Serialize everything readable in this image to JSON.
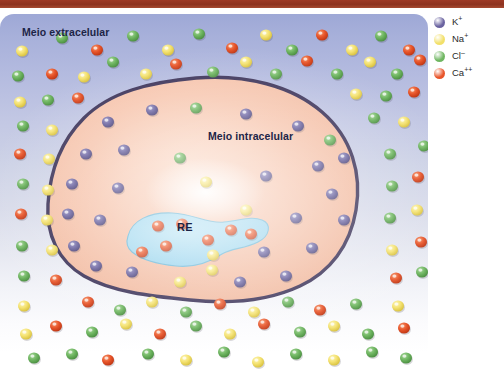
{
  "figure": {
    "title_bar_color": "#8e3320",
    "panel": {
      "extracellular_label": "Meio extracelular",
      "intracellular_label": "Meio intracelular",
      "organelle_label": "RE",
      "extracellular_bg_top": "#9ea8d6",
      "extracellular_bg_bottom": "#ffffff",
      "cytoplasm_color": "#f6c3ac",
      "membrane_color": "#3b3258",
      "organelle_color": "#9ed7ef"
    }
  },
  "legend": {
    "items": [
      {
        "label": "K",
        "charge": "+",
        "color": "#6a63a0",
        "name": "potassium"
      },
      {
        "label": "Na",
        "charge": "+",
        "color": "#f2e06a",
        "name": "sodium"
      },
      {
        "label": "Cl",
        "charge": "–",
        "color": "#6fb661",
        "name": "chloride"
      },
      {
        "label": "Ca",
        "charge": "++",
        "color": "#e8552a",
        "name": "calcium"
      }
    ]
  },
  "ions": {
    "colors": {
      "K": {
        "fill": "#6a63a0",
        "light": "#9a95c4",
        "dark": "#4a4279"
      },
      "Na": {
        "fill": "#f4e271",
        "light": "#fdf6bb",
        "dark": "#d9c23f"
      },
      "Cl": {
        "fill": "#6fb661",
        "light": "#a8d79c",
        "dark": "#4b8f41"
      },
      "Ca": {
        "fill": "#e8552a",
        "light": "#f59a6e",
        "dark": "#bf3714"
      }
    },
    "radius": 6.0,
    "extracellular": [
      {
        "t": "Na",
        "x": 22,
        "y": 37
      },
      {
        "t": "Cl",
        "x": 62,
        "y": 24
      },
      {
        "t": "Ca",
        "x": 97,
        "y": 36
      },
      {
        "t": "Cl",
        "x": 133,
        "y": 22
      },
      {
        "t": "Na",
        "x": 168,
        "y": 36
      },
      {
        "t": "Cl",
        "x": 199,
        "y": 20
      },
      {
        "t": "Ca",
        "x": 232,
        "y": 34
      },
      {
        "t": "Na",
        "x": 266,
        "y": 21
      },
      {
        "t": "Cl",
        "x": 292,
        "y": 36
      },
      {
        "t": "Ca",
        "x": 322,
        "y": 21
      },
      {
        "t": "Na",
        "x": 352,
        "y": 36
      },
      {
        "t": "Cl",
        "x": 381,
        "y": 22
      },
      {
        "t": "Ca",
        "x": 409,
        "y": 36
      },
      {
        "t": "Cl",
        "x": 18,
        "y": 62
      },
      {
        "t": "Ca",
        "x": 52,
        "y": 60
      },
      {
        "t": "Na",
        "x": 84,
        "y": 63
      },
      {
        "t": "Cl",
        "x": 113,
        "y": 48
      },
      {
        "t": "Na",
        "x": 146,
        "y": 60
      },
      {
        "t": "Ca",
        "x": 176,
        "y": 50
      },
      {
        "t": "Cl",
        "x": 213,
        "y": 58
      },
      {
        "t": "Na",
        "x": 246,
        "y": 48
      },
      {
        "t": "Cl",
        "x": 276,
        "y": 60
      },
      {
        "t": "Ca",
        "x": 307,
        "y": 47
      },
      {
        "t": "Cl",
        "x": 337,
        "y": 60
      },
      {
        "t": "Na",
        "x": 370,
        "y": 48
      },
      {
        "t": "Cl",
        "x": 397,
        "y": 60
      },
      {
        "t": "Ca",
        "x": 420,
        "y": 46
      },
      {
        "t": "Na",
        "x": 20,
        "y": 88
      },
      {
        "t": "Cl",
        "x": 48,
        "y": 86
      },
      {
        "t": "Ca",
        "x": 78,
        "y": 84
      },
      {
        "t": "Na",
        "x": 356,
        "y": 80
      },
      {
        "t": "Cl",
        "x": 386,
        "y": 82
      },
      {
        "t": "Ca",
        "x": 414,
        "y": 78
      },
      {
        "t": "Cl",
        "x": 23,
        "y": 112
      },
      {
        "t": "Na",
        "x": 52,
        "y": 116
      },
      {
        "t": "Ca",
        "x": 20,
        "y": 140
      },
      {
        "t": "Cl",
        "x": 374,
        "y": 104
      },
      {
        "t": "Na",
        "x": 404,
        "y": 108
      },
      {
        "t": "Cl",
        "x": 424,
        "y": 132
      },
      {
        "t": "Na",
        "x": 49,
        "y": 145
      },
      {
        "t": "Cl",
        "x": 23,
        "y": 170
      },
      {
        "t": "Na",
        "x": 48,
        "y": 176
      },
      {
        "t": "Cl",
        "x": 390,
        "y": 140
      },
      {
        "t": "Ca",
        "x": 418,
        "y": 163
      },
      {
        "t": "Cl",
        "x": 392,
        "y": 172
      },
      {
        "t": "Ca",
        "x": 21,
        "y": 200
      },
      {
        "t": "Na",
        "x": 47,
        "y": 206
      },
      {
        "t": "Cl",
        "x": 22,
        "y": 232
      },
      {
        "t": "Na",
        "x": 52,
        "y": 236
      },
      {
        "t": "Na",
        "x": 417,
        "y": 196
      },
      {
        "t": "Cl",
        "x": 390,
        "y": 204
      },
      {
        "t": "Ca",
        "x": 421,
        "y": 228
      },
      {
        "t": "Na",
        "x": 392,
        "y": 236
      },
      {
        "t": "Cl",
        "x": 24,
        "y": 262
      },
      {
        "t": "Ca",
        "x": 56,
        "y": 266
      },
      {
        "t": "Na",
        "x": 24,
        "y": 292
      },
      {
        "t": "Ca",
        "x": 396,
        "y": 264
      },
      {
        "t": "Cl",
        "x": 422,
        "y": 258
      },
      {
        "t": "Na",
        "x": 398,
        "y": 292
      },
      {
        "t": "Ca",
        "x": 88,
        "y": 288
      },
      {
        "t": "Cl",
        "x": 120,
        "y": 296
      },
      {
        "t": "Na",
        "x": 152,
        "y": 288
      },
      {
        "t": "Cl",
        "x": 186,
        "y": 298
      },
      {
        "t": "Ca",
        "x": 220,
        "y": 290
      },
      {
        "t": "Na",
        "x": 254,
        "y": 298
      },
      {
        "t": "Cl",
        "x": 288,
        "y": 288
      },
      {
        "t": "Ca",
        "x": 320,
        "y": 296
      },
      {
        "t": "Cl",
        "x": 356,
        "y": 290
      },
      {
        "t": "Ca",
        "x": 56,
        "y": 312
      },
      {
        "t": "Cl",
        "x": 92,
        "y": 318
      },
      {
        "t": "Na",
        "x": 126,
        "y": 310
      },
      {
        "t": "Ca",
        "x": 160,
        "y": 320
      },
      {
        "t": "Cl",
        "x": 196,
        "y": 312
      },
      {
        "t": "Na",
        "x": 230,
        "y": 320
      },
      {
        "t": "Ca",
        "x": 264,
        "y": 310
      },
      {
        "t": "Cl",
        "x": 300,
        "y": 318
      },
      {
        "t": "Na",
        "x": 334,
        "y": 312
      },
      {
        "t": "Cl",
        "x": 368,
        "y": 320
      },
      {
        "t": "Ca",
        "x": 404,
        "y": 314
      },
      {
        "t": "Na",
        "x": 26,
        "y": 320
      },
      {
        "t": "Cl",
        "x": 34,
        "y": 344
      },
      {
        "t": "Cl",
        "x": 72,
        "y": 340
      },
      {
        "t": "Ca",
        "x": 108,
        "y": 346
      },
      {
        "t": "Cl",
        "x": 148,
        "y": 340
      },
      {
        "t": "Na",
        "x": 186,
        "y": 346
      },
      {
        "t": "Cl",
        "x": 224,
        "y": 338
      },
      {
        "t": "Na",
        "x": 258,
        "y": 348
      },
      {
        "t": "Cl",
        "x": 296,
        "y": 340
      },
      {
        "t": "Na",
        "x": 334,
        "y": 346
      },
      {
        "t": "Cl",
        "x": 372,
        "y": 338
      },
      {
        "t": "Cl",
        "x": 406,
        "y": 344
      }
    ],
    "intracellular": [
      {
        "t": "K",
        "x": 108,
        "y": 108
      },
      {
        "t": "K",
        "x": 152,
        "y": 96
      },
      {
        "t": "Cl",
        "x": 196,
        "y": 94
      },
      {
        "t": "K",
        "x": 246,
        "y": 100
      },
      {
        "t": "K",
        "x": 298,
        "y": 112
      },
      {
        "t": "Cl",
        "x": 330,
        "y": 126
      },
      {
        "t": "K",
        "x": 86,
        "y": 140
      },
      {
        "t": "K",
        "x": 124,
        "y": 136
      },
      {
        "t": "Cl",
        "x": 180,
        "y": 144
      },
      {
        "t": "K",
        "x": 318,
        "y": 152
      },
      {
        "t": "K",
        "x": 344,
        "y": 144
      },
      {
        "t": "K",
        "x": 72,
        "y": 170
      },
      {
        "t": "K",
        "x": 118,
        "y": 174
      },
      {
        "t": "Na",
        "x": 206,
        "y": 168
      },
      {
        "t": "K",
        "x": 266,
        "y": 162
      },
      {
        "t": "K",
        "x": 332,
        "y": 180
      },
      {
        "t": "K",
        "x": 68,
        "y": 200
      },
      {
        "t": "K",
        "x": 100,
        "y": 206
      },
      {
        "t": "Na",
        "x": 246,
        "y": 196
      },
      {
        "t": "K",
        "x": 296,
        "y": 204
      },
      {
        "t": "K",
        "x": 344,
        "y": 206
      },
      {
        "t": "K",
        "x": 74,
        "y": 232
      },
      {
        "t": "K",
        "x": 264,
        "y": 238
      },
      {
        "t": "K",
        "x": 312,
        "y": 234
      },
      {
        "t": "K",
        "x": 96,
        "y": 252
      },
      {
        "t": "K",
        "x": 132,
        "y": 258
      },
      {
        "t": "Na",
        "x": 212,
        "y": 256
      },
      {
        "t": "K",
        "x": 286,
        "y": 262
      },
      {
        "t": "Na",
        "x": 180,
        "y": 268
      },
      {
        "t": "K",
        "x": 240,
        "y": 268
      }
    ],
    "reticulum": [
      {
        "t": "Ca",
        "x": 158,
        "y": 212
      },
      {
        "t": "Ca",
        "x": 182,
        "y": 210
      },
      {
        "t": "Ca",
        "x": 208,
        "y": 226
      },
      {
        "t": "Ca",
        "x": 166,
        "y": 232
      },
      {
        "t": "Ca",
        "x": 142,
        "y": 238
      },
      {
        "t": "Ca",
        "x": 231,
        "y": 216
      },
      {
        "t": "Ca",
        "x": 251,
        "y": 220
      },
      {
        "t": "Na",
        "x": 213,
        "y": 241
      }
    ]
  }
}
